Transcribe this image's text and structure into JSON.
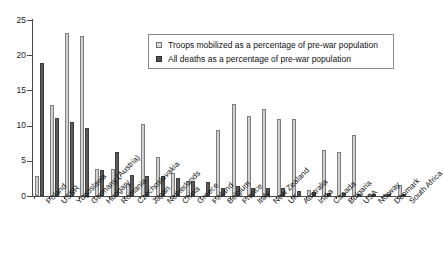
{
  "chart_data": {
    "type": "bar",
    "title": "",
    "subtitle": "",
    "xlabel": "",
    "ylabel": "",
    "ylim": [
      0,
      25
    ],
    "yticks": [
      0,
      5,
      10,
      15,
      20,
      25
    ],
    "grid": false,
    "legend_position": "top-right",
    "categories": [
      "Poland",
      "USSR",
      "Yugoslavia",
      "Germany (Austria)",
      "Hungary",
      "Romania",
      "Czechoslovakia",
      "Japan",
      "Netherlands",
      "China",
      "Greece",
      "Finland",
      "Belgium",
      "France",
      "Italy",
      "New Zealand",
      "UK",
      "Australia",
      "India",
      "Canada",
      "Bulgaria",
      "USA",
      "Norway",
      "Denmark",
      "South Africa"
    ],
    "series": [
      {
        "name": "Troops mobilized as a percentage of pre-war population",
        "color": "#c9c9c9",
        "values": [
          2.8,
          12.9,
          23.1,
          22.8,
          3.8,
          3.8,
          1.7,
          10.2,
          5.5,
          3.3,
          2.1,
          0.0,
          9.4,
          13.0,
          11.4,
          12.4,
          11.0,
          11.0,
          0.9,
          6.6,
          6.2,
          8.6,
          0.3,
          0.2,
          1.5
        ],
        "note": "Finland, Norway, Denmark troop bars are negligible/absent"
      },
      {
        "name": "All deaths as a percentage of pre-war population",
        "color": "#5c5c5c",
        "values": [
          18.9,
          11.1,
          10.5,
          9.7,
          3.7,
          6.2,
          3.0,
          2.9,
          2.8,
          2.6,
          2.2,
          2.0,
          1.1,
          1.4,
          1.1,
          1.2,
          1.1,
          0.7,
          0.6,
          0.4,
          0.4,
          0.3,
          0.1,
          0.1,
          0.1
        ]
      }
    ]
  },
  "legend": {
    "items": [
      {
        "label": "Troops mobilized as a percentage of pre-war population",
        "marker": "open-square-icon"
      },
      {
        "label": "All deaths as a percentage of pre-war population",
        "marker": "filled-square-icon"
      }
    ]
  },
  "axes": {
    "y": {
      "tick_labels": [
        "25",
        "20",
        "15",
        "10",
        "5",
        "0"
      ]
    }
  },
  "colors": {
    "troops": "#c9c9c9",
    "deaths": "#5c5c5c",
    "axis": "#4a4a4a",
    "text": "#111111",
    "background": "#ffffff"
  }
}
